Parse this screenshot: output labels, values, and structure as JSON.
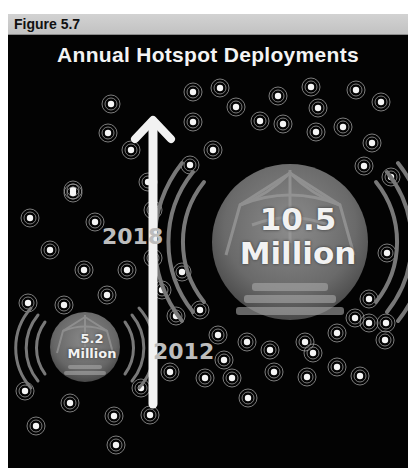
{
  "figure_label": "Figure 5.7",
  "title": "Annual Hotspot Deployments",
  "colors": {
    "background": "#030303",
    "header_bar": "#c8c8c8",
    "text": "#f4f4f4",
    "year_text": "#bdbdbd",
    "wave": "#7a7a7a"
  },
  "arrow": {
    "direction": "up",
    "color": "#f2f2f2"
  },
  "labels": {
    "year_2018": "2018",
    "year_2012": "2012"
  },
  "stats": [
    {
      "year": "2018",
      "value": "10.5",
      "unit": "Million",
      "icon": "wifi-hotspot-icon",
      "size": "large"
    },
    {
      "year": "2012",
      "value": "5.2",
      "unit": "Million",
      "icon": "wifi-hotspot-icon",
      "size": "small"
    }
  ],
  "chart_data": {
    "type": "bubble",
    "title": "Annual Hotspot Deployments",
    "categories": [
      "2012",
      "2018"
    ],
    "values": [
      5.2,
      10.5
    ],
    "unit": "Million",
    "xlabel": "",
    "ylabel": ""
  }
}
